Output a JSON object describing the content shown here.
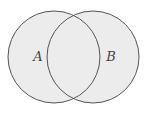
{
  "diagram": {
    "type": "venn",
    "sets": [
      {
        "id": "A",
        "label": "A",
        "cx": 54,
        "cy": 57,
        "r": 46
      },
      {
        "id": "B",
        "label": "B",
        "cx": 93,
        "cy": 57,
        "r": 46
      }
    ],
    "label_positions": {
      "A": {
        "x": 38,
        "y": 61
      },
      "B": {
        "x": 111,
        "y": 61
      }
    },
    "colors": {
      "fill": "#ececec",
      "stroke": "#555555",
      "label": "#444444",
      "background": "#ffffff"
    }
  }
}
